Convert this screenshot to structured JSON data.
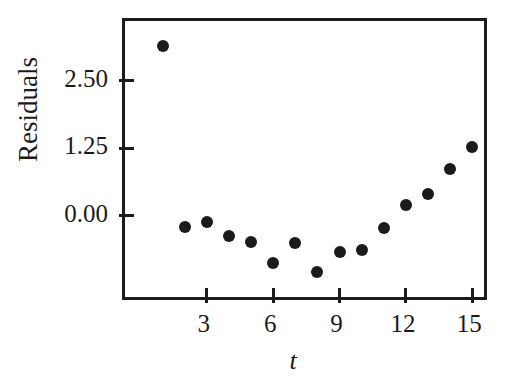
{
  "chart_data": {
    "type": "scatter",
    "title": "",
    "xlabel": "t",
    "ylabel": "Residuals",
    "x": [
      1,
      2,
      3,
      4,
      5,
      6,
      7,
      8,
      9,
      10,
      11,
      12,
      13,
      14,
      15
    ],
    "values": [
      3.14,
      -0.21,
      -0.12,
      -0.37,
      -0.48,
      -0.87,
      -0.5,
      -1.05,
      -0.68,
      -0.64,
      -0.23,
      0.19,
      0.41,
      0.87,
      1.28
    ],
    "series": [
      {
        "name": "Residuals",
        "values": [
          3.14,
          -0.21,
          -0.12,
          -0.37,
          -0.48,
          -0.87,
          -0.5,
          -1.05,
          -0.68,
          -0.64,
          -0.23,
          0.19,
          0.41,
          0.87,
          1.28
        ]
      }
    ],
    "xtick_labels": [
      "3",
      "6",
      "9",
      "12",
      "15"
    ],
    "xtick_values": [
      3,
      6,
      9,
      12,
      15
    ],
    "ytick_labels": [
      "0.00",
      "1.25",
      "2.50"
    ],
    "ytick_values": [
      0.0,
      1.25,
      2.5
    ],
    "xlim": [
      -0.7,
      15.8
    ],
    "ylim": [
      -1.62,
      3.61
    ],
    "grid": false,
    "legend": false,
    "marker": "filled-circle",
    "marker_color": "#1b1b1b",
    "axis_color": "#1c1c1c",
    "background_color": "#ffffff"
  },
  "figure": {
    "ylabel_text": "Residuals",
    "xlabel_text": "t"
  }
}
